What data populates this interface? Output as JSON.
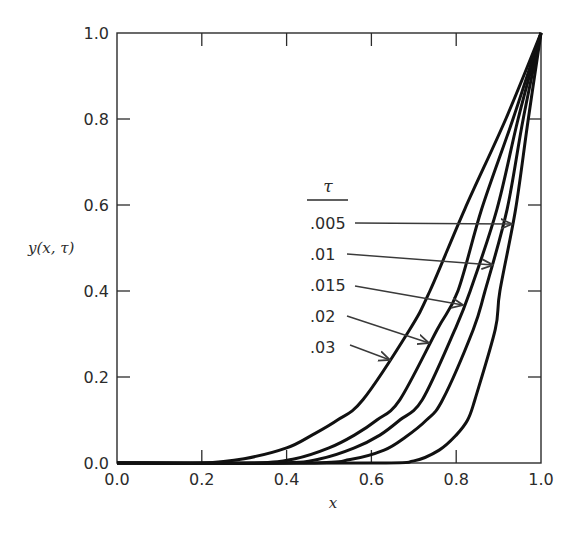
{
  "chart_data": {
    "type": "line",
    "title": "",
    "xlabel": "x",
    "ylabel": "y(x, τ)",
    "xlim": [
      0.0,
      1.0
    ],
    "ylim": [
      0.0,
      1.0
    ],
    "xticks": [
      "0.0",
      "0.2",
      "0.4",
      "0.6",
      "0.8",
      "1.0"
    ],
    "yticks": [
      "0.0",
      "0.2",
      "0.4",
      "0.6",
      "0.8",
      "1.0"
    ],
    "grid": false,
    "legend": {
      "title": "τ",
      "position": "center-right, inside plot, labels with arrows pointing to curves",
      "entries": [
        ".005",
        ".01",
        ".015",
        ".02",
        ".03"
      ]
    },
    "series": [
      {
        "name": ".005",
        "x": [
          0.0,
          0.6,
          0.7,
          0.76,
          0.8,
          0.827,
          0.844,
          0.892,
          0.903,
          0.94,
          0.97,
          1.0
        ],
        "y": [
          0.0,
          0.0,
          0.005,
          0.03,
          0.065,
          0.1,
          0.147,
          0.31,
          0.4,
          0.59,
          0.8,
          1.0
        ]
      },
      {
        "name": ".01",
        "x": [
          0.0,
          0.45,
          0.55,
          0.63,
          0.68,
          0.73,
          0.768,
          0.84,
          0.868,
          0.92,
          0.958,
          1.0
        ],
        "y": [
          0.0,
          0.0,
          0.008,
          0.03,
          0.06,
          0.1,
          0.147,
          0.31,
          0.4,
          0.59,
          0.8,
          1.0
        ]
      },
      {
        "name": ".015",
        "x": [
          0.0,
          0.38,
          0.48,
          0.56,
          0.62,
          0.667,
          0.72,
          0.797,
          0.833,
          0.896,
          0.946,
          1.0
        ],
        "y": [
          0.0,
          0.0,
          0.01,
          0.035,
          0.065,
          0.1,
          0.147,
          0.31,
          0.4,
          0.59,
          0.8,
          1.0
        ]
      },
      {
        "name": ".02",
        "x": [
          0.0,
          0.32,
          0.42,
          0.5,
          0.56,
          0.613,
          0.667,
          0.755,
          0.804,
          0.86,
          0.934,
          1.0
        ],
        "y": [
          0.0,
          0.0,
          0.01,
          0.035,
          0.065,
          0.1,
          0.147,
          0.31,
          0.4,
          0.59,
          0.8,
          1.0
        ]
      },
      {
        "name": ".03",
        "x": [
          0.0,
          0.2,
          0.3,
          0.4,
          0.46,
          0.52,
          0.58,
          0.69,
          0.738,
          0.82,
          0.917,
          1.0
        ],
        "y": [
          0.0,
          0.0,
          0.01,
          0.035,
          0.065,
          0.1,
          0.147,
          0.31,
          0.4,
          0.59,
          0.8,
          1.0
        ]
      }
    ],
    "annotations": [
      {
        "text": ".005",
        "label_xy": [
          310,
          223
        ],
        "arrow_from": [
          355,
          223
        ],
        "arrow_to": [
          512,
          224
        ]
      },
      {
        "text": ".01",
        "label_xy": [
          310,
          254
        ],
        "arrow_from": [
          347,
          254
        ],
        "arrow_to": [
          493,
          265
        ]
      },
      {
        "text": ".015",
        "label_xy": [
          310,
          285
        ],
        "arrow_from": [
          355,
          286
        ],
        "arrow_to": [
          463,
          305
        ]
      },
      {
        "text": ".02",
        "label_xy": [
          310,
          316
        ],
        "arrow_from": [
          347,
          316
        ],
        "arrow_to": [
          429,
          343
        ]
      },
      {
        "text": ".03",
        "label_xy": [
          310,
          347
        ],
        "arrow_from": [
          350,
          345
        ],
        "arrow_to": [
          390,
          360
        ]
      }
    ]
  },
  "colors": {
    "curve": "#111111",
    "axis": "#2b2b2b",
    "arrow": "#3a3a3a"
  }
}
